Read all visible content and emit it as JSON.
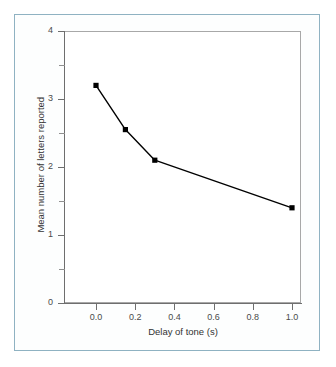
{
  "figure": {
    "frame_color": "#8fb2c2",
    "background_color": "#ffffff",
    "line_color": "#000000",
    "axis_color": "#6e6e6e"
  },
  "chart_data": {
    "type": "line",
    "title": "",
    "subtitle": "",
    "xlabel": "Delay of tone (s)",
    "ylabel": "Mean number of letters reported",
    "x": [
      0.0,
      0.15,
      0.3,
      1.0
    ],
    "values": [
      3.2,
      2.55,
      2.1,
      1.4
    ],
    "series": [
      {
        "name": "Mean letters reported",
        "x": [
          0.0,
          0.15,
          0.3,
          1.0
        ],
        "values": [
          3.2,
          2.55,
          2.1,
          1.4
        ]
      }
    ],
    "xlim": [
      0.0,
      1.0
    ],
    "ylim": [
      0,
      4
    ],
    "xticks": [
      0.0,
      0.2,
      0.4,
      0.6,
      0.8,
      1.0
    ],
    "xticklabels": [
      "0.0",
      "0.2",
      "0.4",
      "0.6",
      "0.8",
      "1.0"
    ],
    "yticks": [
      0,
      1,
      2,
      3,
      4
    ],
    "yticklabels": [
      "0",
      "1",
      "2",
      "3",
      "4"
    ],
    "y_minor_ticks": [
      0.5,
      1.5,
      2.5,
      3.5
    ],
    "grid": false,
    "legend": false,
    "legend_position": "none",
    "marker": "square",
    "marker_color": "#000000",
    "line_style": "solid",
    "annotations": []
  }
}
